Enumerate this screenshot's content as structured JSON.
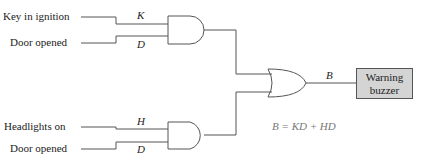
{
  "diagram": {
    "inputs": [
      {
        "label": "Key in ignition",
        "var": "K"
      },
      {
        "label": "Door opened",
        "var": "D"
      },
      {
        "label": "Headlights on",
        "var": "H"
      },
      {
        "label": "Door opened",
        "var": "D"
      }
    ],
    "output_var": "B",
    "output_box": {
      "line1": "Warning",
      "line2": "buzzer",
      "fill": "#d4d4d4"
    },
    "equation": "B = KD + HD",
    "gates": [
      "AND",
      "AND",
      "OR"
    ]
  }
}
